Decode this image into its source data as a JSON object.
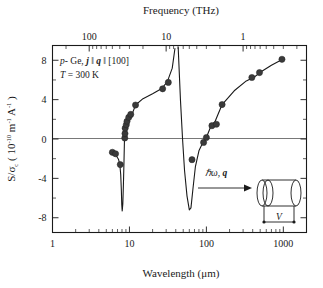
{
  "figure": {
    "background": "#ffffff",
    "ink": "#1a1a1a",
    "marker_color": "#3a3a3a"
  },
  "annotations": {
    "sample_prefix_italic": "p",
    "sample_rest": "- Ge, ",
    "j_symbol": "j",
    "par1": " ‖ ",
    "q_symbol": "q",
    "par2": " ‖ ",
    "orientation": "[100]",
    "temperature_symbol": "T",
    "temperature_value": " = 300 K"
  },
  "inset": {
    "photon_symbol": "ℏω,",
    "wavevector_symbol": "q",
    "voltage_label": "V",
    "arrow_name": "incident-beam-arrow",
    "sample_name": "cylindrical-sample"
  },
  "chart_data": {
    "type": "line",
    "title": "",
    "xlabel": "Wavelength (μm)",
    "ylabel": "S/σ_c ( 10^-10 m^-1 A^-1 )",
    "ylabel_parts": {
      "prefix": "S/",
      "sigma": "σ",
      "sigma_sub": "c",
      "open": " ( 10",
      "exp1": "-10",
      "unit1": " m",
      "exp2": "-1",
      "unit2": " A",
      "exp3": "-1",
      "close": " )"
    },
    "top_xlabel": "Frequency (THz)",
    "xscale": "log",
    "xlim": [
      1,
      2000
    ],
    "ylim": [
      -9.5,
      9.5
    ],
    "grid": false,
    "legend": "none",
    "x_ticks": [
      {
        "value": 1,
        "label": "1"
      },
      {
        "value": 10,
        "label": "10"
      },
      {
        "value": 100,
        "label": "100"
      },
      {
        "value": 1000,
        "label": "1000"
      }
    ],
    "y_ticks": [
      {
        "value": 8,
        "label": "8"
      },
      {
        "value": 4,
        "label": "4"
      },
      {
        "value": 0,
        "label": "0"
      },
      {
        "value": -4,
        "label": "-4"
      },
      {
        "value": -8,
        "label": "-8"
      }
    ],
    "top_x_ticks": [
      {
        "value": 3.0,
        "label": "100"
      },
      {
        "value": 30.0,
        "label": "10"
      },
      {
        "value": 300.0,
        "label": "1"
      }
    ],
    "zero_reference_line": 0,
    "series": [
      {
        "name": "theory-branch-left",
        "kind": "curve",
        "points": [
          [
            5.6,
            -1.45
          ],
          [
            6.2,
            -1.55
          ],
          [
            6.8,
            -1.75
          ],
          [
            7.2,
            -2.05
          ],
          [
            7.5,
            -2.6
          ],
          [
            7.7,
            -3.6
          ],
          [
            7.85,
            -5.2
          ],
          [
            7.95,
            -6.7
          ],
          [
            8.05,
            -7.3
          ],
          [
            8.2,
            -6.6
          ],
          [
            8.35,
            -4.6
          ],
          [
            8.5,
            -2.2
          ],
          [
            8.62,
            0.0
          ],
          [
            8.75,
            1.1
          ],
          [
            9.0,
            1.55
          ],
          [
            9.6,
            1.9
          ],
          [
            10.5,
            2.25
          ],
          [
            12.0,
            3.45
          ],
          [
            15.0,
            4.1
          ],
          [
            20.0,
            4.6
          ],
          [
            26.0,
            5.1
          ],
          [
            31.0,
            5.8
          ],
          [
            36.0,
            7.2
          ],
          [
            39.0,
            9.2
          ]
        ]
      },
      {
        "name": "theory-branch-right",
        "kind": "curve",
        "points": [
          [
            43.0,
            9.3
          ],
          [
            46.0,
            4.0
          ],
          [
            49.0,
            0.0
          ],
          [
            52.0,
            -3.2
          ],
          [
            56.0,
            -5.8
          ],
          [
            60.0,
            -7.2
          ],
          [
            63.0,
            -7.0
          ],
          [
            67.0,
            -5.0
          ],
          [
            72.0,
            -2.8
          ],
          [
            80.0,
            -1.2
          ],
          [
            90.0,
            -0.35
          ],
          [
            100.0,
            0.15
          ],
          [
            115.0,
            1.35
          ],
          [
            130.0,
            1.8
          ],
          [
            160.0,
            3.5
          ],
          [
            230.0,
            4.9
          ],
          [
            330.0,
            5.9
          ],
          [
            420.0,
            6.3
          ],
          [
            520.0,
            6.85
          ],
          [
            700.0,
            7.5
          ],
          [
            980.0,
            8.1
          ]
        ]
      }
    ],
    "data_points": [
      {
        "x": 6.0,
        "y": -1.35
      },
      {
        "x": 6.6,
        "y": -1.5
      },
      {
        "x": 7.6,
        "y": -2.6
      },
      {
        "x": 8.7,
        "y": 0.1
      },
      {
        "x": 8.75,
        "y": 0.55
      },
      {
        "x": 8.8,
        "y": 1.1
      },
      {
        "x": 9.1,
        "y": 1.45
      },
      {
        "x": 9.3,
        "y": 1.8
      },
      {
        "x": 9.8,
        "y": 2.2
      },
      {
        "x": 10.4,
        "y": 2.5
      },
      {
        "x": 12.0,
        "y": 3.45
      },
      {
        "x": 27.0,
        "y": 5.1
      },
      {
        "x": 32.0,
        "y": 5.75
      },
      {
        "x": 65.0,
        "y": -2.1
      },
      {
        "x": 92.0,
        "y": -0.35
      },
      {
        "x": 100.0,
        "y": 0.15
      },
      {
        "x": 118.0,
        "y": 1.35
      },
      {
        "x": 135.0,
        "y": 1.5
      },
      {
        "x": 160.0,
        "y": 3.5
      },
      {
        "x": 390.0,
        "y": 6.25
      },
      {
        "x": 490.0,
        "y": 6.75
      },
      {
        "x": 960.0,
        "y": 8.1
      }
    ]
  }
}
